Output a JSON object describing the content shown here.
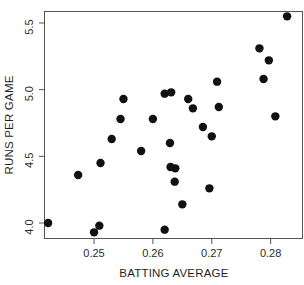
{
  "chart_data": {
    "type": "scatter",
    "title": "",
    "xlabel": "BATTING AVERAGE",
    "ylabel": "RUNS PER GAME",
    "xlim": [
      0.2415,
      0.2855
    ],
    "ylim": [
      3.88,
      5.59
    ],
    "grid": false,
    "legend": "none",
    "xticks": [
      0.25,
      0.26,
      0.27,
      0.28
    ],
    "xtick_labels": [
      "0.25",
      "0.26",
      "0.27",
      "0.28"
    ],
    "yticks": [
      4.0,
      4.5,
      5.0,
      5.5
    ],
    "ytick_labels": [
      "4.0",
      "4.5",
      "5.0",
      "5.5"
    ],
    "marker": "filled-circle",
    "marker_color": "#111111",
    "marker_size": 4.2,
    "n_points": 30,
    "points": [
      {
        "x": 0.2422,
        "y": 4.0
      },
      {
        "x": 0.2473,
        "y": 4.36
      },
      {
        "x": 0.25,
        "y": 3.93
      },
      {
        "x": 0.2509,
        "y": 3.98
      },
      {
        "x": 0.2511,
        "y": 4.45
      },
      {
        "x": 0.253,
        "y": 4.63
      },
      {
        "x": 0.2545,
        "y": 4.78
      },
      {
        "x": 0.255,
        "y": 4.93
      },
      {
        "x": 0.258,
        "y": 4.54
      },
      {
        "x": 0.26,
        "y": 4.78
      },
      {
        "x": 0.262,
        "y": 3.95
      },
      {
        "x": 0.262,
        "y": 4.97
      },
      {
        "x": 0.2631,
        "y": 4.98
      },
      {
        "x": 0.2629,
        "y": 4.6
      },
      {
        "x": 0.263,
        "y": 4.42
      },
      {
        "x": 0.2638,
        "y": 4.41
      },
      {
        "x": 0.2637,
        "y": 4.31
      },
      {
        "x": 0.265,
        "y": 4.14
      },
      {
        "x": 0.266,
        "y": 4.93
      },
      {
        "x": 0.2668,
        "y": 4.86
      },
      {
        "x": 0.2685,
        "y": 4.72
      },
      {
        "x": 0.2696,
        "y": 4.26
      },
      {
        "x": 0.27,
        "y": 4.65
      },
      {
        "x": 0.2709,
        "y": 5.06
      },
      {
        "x": 0.2712,
        "y": 4.87
      },
      {
        "x": 0.2781,
        "y": 5.31
      },
      {
        "x": 0.2788,
        "y": 5.08
      },
      {
        "x": 0.2797,
        "y": 5.22
      },
      {
        "x": 0.2808,
        "y": 4.8
      },
      {
        "x": 0.2828,
        "y": 5.55
      }
    ]
  },
  "layout": {
    "plot_left": 44,
    "plot_right": 303,
    "plot_top": 11,
    "plot_bottom": 239
  }
}
